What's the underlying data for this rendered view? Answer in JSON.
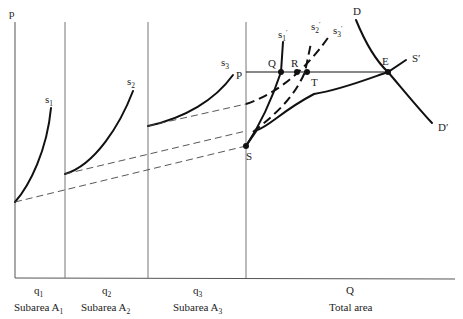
{
  "axis": {
    "y_label": "p"
  },
  "panels": [
    {
      "quantity": "q",
      "quantity_sub": "1",
      "name": "Subarea A",
      "name_sub": "1"
    },
    {
      "quantity": "q",
      "quantity_sub": "2",
      "name": "Subarea A",
      "name_sub": "2"
    },
    {
      "quantity": "q",
      "quantity_sub": "3",
      "name": "Subarea A",
      "name_sub": "3"
    },
    {
      "quantity": "Q",
      "quantity_sub": "",
      "name": "Total area",
      "name_sub": ""
    }
  ],
  "curves": {
    "s1": {
      "label": "s",
      "sub": "1"
    },
    "s2": {
      "label": "s",
      "sub": "2"
    },
    "s3": {
      "label": "s",
      "sub": "3"
    },
    "s1p": {
      "label": "s",
      "sub": "1",
      "prime": "′"
    },
    "s2p": {
      "label": "s",
      "sub": "2",
      "prime": "′"
    },
    "s3p": {
      "label": "s",
      "sub": "3",
      "prime": "′"
    },
    "D": {
      "label": "D"
    },
    "Dp": {
      "label": "D′"
    },
    "Sp": {
      "label": "S′"
    }
  },
  "points": {
    "P": "P",
    "Q": "Q",
    "R": "R",
    "T": "T",
    "E": "E",
    "S": "S"
  }
}
